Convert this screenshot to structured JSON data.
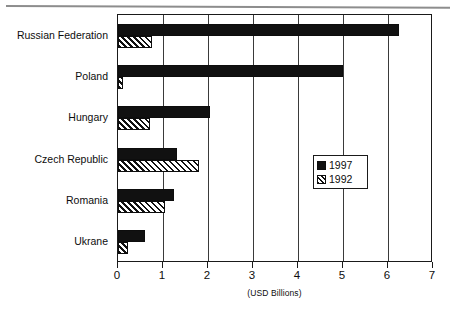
{
  "chart_data": {
    "type": "bar",
    "orientation": "horizontal",
    "title": "",
    "subtitle": "",
    "xlabel": "(USD Billions)",
    "ylabel": "",
    "xlim": [
      0,
      7
    ],
    "xticks": [
      "0",
      "1",
      "2",
      "3",
      "4",
      "5",
      "6",
      "7"
    ],
    "grid": "vertical",
    "legend_position": "right-middle",
    "categories": [
      "Russian Federation",
      "Poland",
      "Hungary",
      "Czech Republic",
      "Romania",
      "Ukrane"
    ],
    "series": [
      {
        "name": "1997",
        "fill": "solid-black",
        "color": "#111111",
        "values": [
          6.25,
          5.0,
          2.05,
          1.3,
          1.25,
          0.6
        ]
      },
      {
        "name": "1992",
        "fill": "diagonal-hatch",
        "color": "#111111",
        "values": [
          0.75,
          0.12,
          0.7,
          1.8,
          1.05,
          0.22
        ]
      }
    ]
  },
  "legend": {
    "entries": [
      {
        "label": "1997",
        "swatch": "solid-black-swatch"
      },
      {
        "label": "1992",
        "swatch": "hatched-swatch"
      }
    ]
  },
  "axis": {
    "x_title": "(USD Billions)"
  }
}
